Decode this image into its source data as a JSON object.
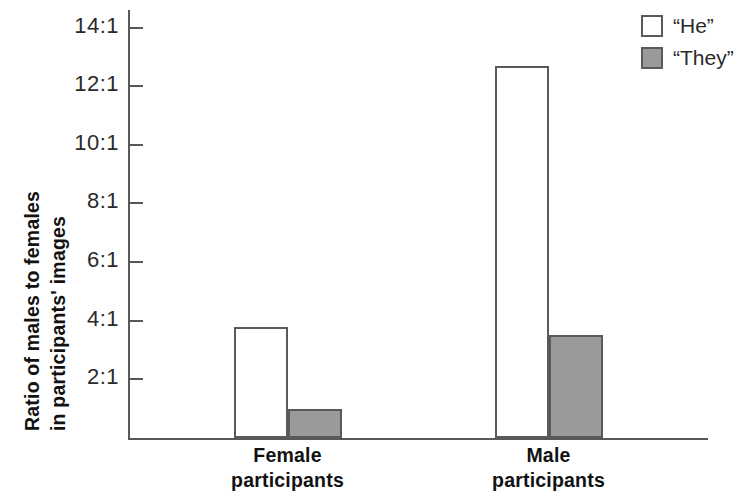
{
  "chart_data": {
    "type": "bar",
    "title": "",
    "subtitle": "",
    "xlabel": "",
    "ylabel": "Ratio of males to females in participants' images",
    "ylabel_lines": [
      "Ratio of males to females",
      "in participants' images"
    ],
    "categories": [
      "Female participants",
      "Male participants"
    ],
    "category_lines": [
      [
        "Female",
        "participants"
      ],
      [
        "Male",
        "participants"
      ]
    ],
    "series": [
      {
        "name": "“He”",
        "values": [
          3.8,
          12.7
        ],
        "color": "#ffffff"
      },
      {
        "name": "“They”",
        "values": [
          1.0,
          3.5
        ],
        "color": "#9a9a9a"
      }
    ],
    "ylim": [
      0,
      14.6
    ],
    "yticks": [
      2,
      4,
      6,
      8,
      10,
      12,
      14
    ],
    "ytick_labels": [
      "2:1",
      "4:1",
      "6:1",
      "8:1",
      "10:1",
      "12:1",
      "14:1"
    ],
    "grid": false,
    "legend_position": "top-right",
    "axis_color": "#575757",
    "bar_edge_color": "#5a5a5a",
    "text_color": "#121212"
  },
  "legend": {
    "items": [
      {
        "label": "“He”",
        "swatch": "he"
      },
      {
        "label": "“They”",
        "swatch": "they"
      }
    ]
  }
}
